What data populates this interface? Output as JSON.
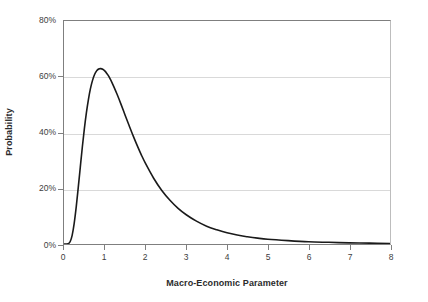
{
  "chart_data": {
    "type": "line",
    "title": "",
    "subtitle": "",
    "xlabel": "Macro-Economic Parameter",
    "ylabel": "Probability",
    "xlim": [
      0,
      8
    ],
    "ylim": [
      0,
      0.8
    ],
    "grid": true,
    "legend_position": "none",
    "x_ticks": [
      "0",
      "1",
      "2",
      "3",
      "4",
      "5",
      "6",
      "7",
      "8"
    ],
    "x_tick_values": [
      0,
      1,
      2,
      3,
      4,
      5,
      6,
      7,
      8
    ],
    "y_ticks": [
      "0%",
      "20%",
      "40%",
      "60%",
      "80%"
    ],
    "y_tick_values": [
      0,
      0.2,
      0.4,
      0.6,
      0.8
    ],
    "series": [
      {
        "name": "Probability density",
        "color": "#1a1a1a",
        "line_width": 1.6,
        "x": [
          0.0,
          0.1,
          0.15,
          0.2,
          0.25,
          0.3,
          0.35,
          0.4,
          0.45,
          0.5,
          0.55,
          0.6,
          0.65,
          0.7,
          0.75,
          0.8,
          0.85,
          0.9,
          0.95,
          1.0,
          1.05,
          1.1,
          1.2,
          1.3,
          1.4,
          1.5,
          1.6,
          1.7,
          1.8,
          1.9,
          2.0,
          2.2,
          2.4,
          2.6,
          2.8,
          3.0,
          3.25,
          3.5,
          3.75,
          4.0,
          4.25,
          4.5,
          4.75,
          5.0,
          5.5,
          6.0,
          6.5,
          7.0,
          7.5,
          8.0
        ],
        "y": [
          0.0,
          0.001,
          0.008,
          0.031,
          0.074,
          0.133,
          0.203,
          0.276,
          0.348,
          0.414,
          0.471,
          0.519,
          0.558,
          0.587,
          0.608,
          0.621,
          0.628,
          0.629,
          0.627,
          0.621,
          0.612,
          0.601,
          0.572,
          0.538,
          0.501,
          0.462,
          0.424,
          0.387,
          0.352,
          0.319,
          0.289,
          0.236,
          0.192,
          0.157,
          0.128,
          0.105,
          0.082,
          0.064,
          0.051,
          0.04,
          0.032,
          0.026,
          0.021,
          0.017,
          0.012,
          0.008,
          0.006,
          0.004,
          0.003,
          0.002
        ]
      }
    ],
    "peak": {
      "x": 0.95,
      "y": 0.628,
      "label": "~63%"
    },
    "annotations": []
  }
}
